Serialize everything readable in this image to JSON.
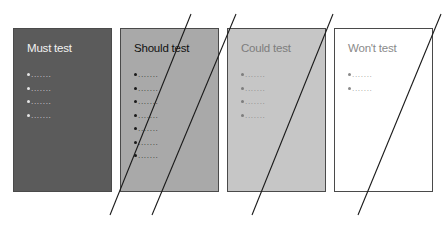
{
  "diagram": {
    "boxes": [
      {
        "id": "must",
        "title": "Must test",
        "bullets": [
          "·······",
          "·······",
          "·······",
          "·······"
        ],
        "fill": "#5b5b5b",
        "text_color": "#f2f2f2",
        "bullet_color": "#e6e6e6"
      },
      {
        "id": "should",
        "title": "Should test",
        "bullets": [
          "·······",
          "·······",
          "·······",
          "·······",
          "·······",
          "·······",
          "·······"
        ],
        "fill": "#a9a9a9",
        "text_color": "#111111",
        "bullet_color": "#1a1a1a"
      },
      {
        "id": "could",
        "title": "Could test",
        "bullets": [
          "·······",
          "·······",
          "·······",
          "·······"
        ],
        "fill": "#c6c6c6",
        "text_color": "#7d7d7d",
        "bullet_color": "#7d7d7d"
      },
      {
        "id": "wont",
        "title": "Won't test",
        "bullets": [
          "·······",
          "·······"
        ],
        "fill": "#ffffff",
        "text_color": "#8a8a8a",
        "bullet_color": "#8a8a8a"
      }
    ],
    "cut_lines": [
      {
        "x1": 191,
        "y1": 14,
        "x2": 110,
        "y2": 215
      },
      {
        "x1": 236,
        "y1": 14,
        "x2": 152,
        "y2": 215
      },
      {
        "x1": 333,
        "y1": 14,
        "x2": 252,
        "y2": 215
      },
      {
        "x1": 441,
        "y1": 14,
        "x2": 358,
        "y2": 215
      }
    ],
    "line_color": "#1a1a1a",
    "border_color": "#4a4a4a"
  }
}
